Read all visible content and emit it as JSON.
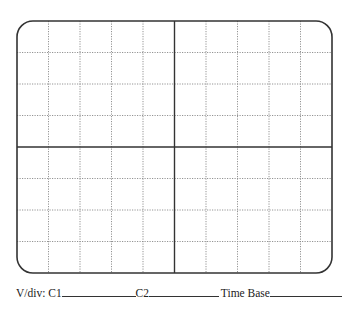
{
  "graticule": {
    "x": 17,
    "y": 21,
    "width": 315,
    "height": 252,
    "corner_radius": 16,
    "h_divisions": 10,
    "v_divisions": 8,
    "border_color": "#333333",
    "center_line_color": "#333333",
    "grid_line_color": "#888888"
  },
  "labels": {
    "vdiv_c1": "V/div: C1",
    "c2": "C2",
    "time_base": "Time Base"
  }
}
